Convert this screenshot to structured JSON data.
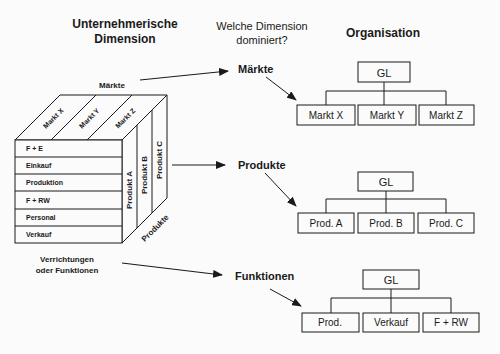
{
  "headers": {
    "dimension": [
      "Unternehmerische",
      "Dimension"
    ],
    "question": [
      "Welche Dimension",
      "dominiert?"
    ],
    "organisation": "Organisation"
  },
  "cube": {
    "top_axis_label": "Märkte",
    "top_face": [
      "Markt X",
      "Markt Y",
      "Markt Z"
    ],
    "front_rows": [
      "F + E",
      "Einkauf",
      "Produktion",
      "F + RW",
      "Personal",
      "Verkauf"
    ],
    "right_face": [
      "Produkt A",
      "Produkt B",
      "Produkt C"
    ],
    "right_axis_label": "Produkte",
    "bottom_axis_label": [
      "Verrichtungen",
      "oder Funktionen"
    ]
  },
  "outcomes": [
    {
      "label": "Märkte",
      "root": "GL",
      "children": [
        "Markt X",
        "Markt Y",
        "Markt Z"
      ]
    },
    {
      "label": "Produkte",
      "root": "GL",
      "children": [
        "Prod. A",
        "Prod. B",
        "Prod. C"
      ]
    },
    {
      "label": "Funktionen",
      "root": "GL",
      "children": [
        "Prod.",
        "Verkauf",
        "F + RW"
      ]
    }
  ]
}
